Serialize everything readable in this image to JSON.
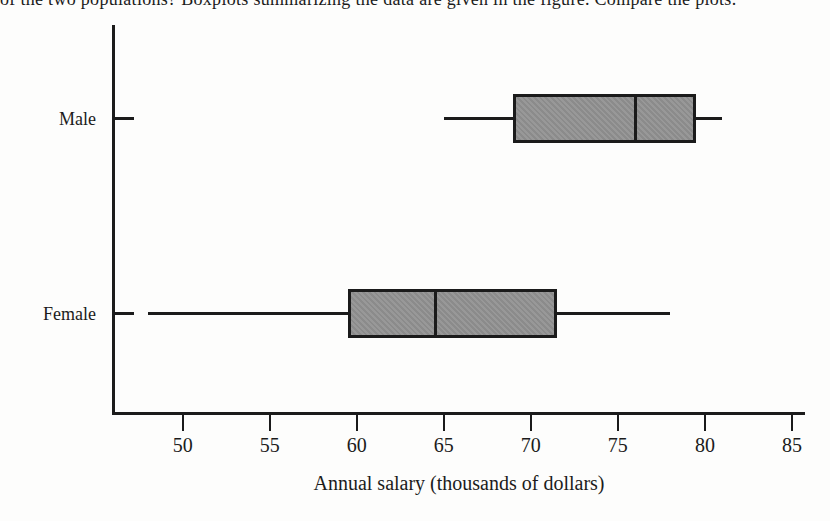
{
  "page": {
    "clipped_top_text": "of the two populations? Boxplots summarizing the data are given in the figure. Compare the plots."
  },
  "chart_data": {
    "type": "boxplot",
    "orientation": "horizontal",
    "title": "",
    "xlabel": "Annual salary (thousands of dollars)",
    "ylabel": "",
    "categories": [
      "Male",
      "Female"
    ],
    "series": [
      {
        "name": "Male",
        "min": 65,
        "q1": 69,
        "median": 76,
        "q3": 79.5,
        "max": 81
      },
      {
        "name": "Female",
        "min": 48,
        "q1": 59.5,
        "median": 64.5,
        "q3": 71.5,
        "max": 78
      }
    ],
    "x_ticks": [
      50,
      55,
      60,
      65,
      70,
      75,
      80,
      85
    ],
    "xlim": [
      46,
      85.75
    ],
    "grid": false,
    "legend": false,
    "colors": {
      "box_fill": "#929292",
      "line": "#1b1b1b",
      "background": "#fdfdfc"
    }
  }
}
